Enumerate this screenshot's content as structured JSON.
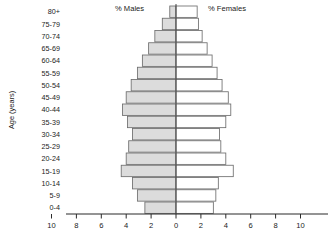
{
  "chart_data": {
    "type": "bar",
    "subtype": "population-pyramid",
    "title": "",
    "xlabel": "",
    "ylabel": "Age (years)",
    "grid": false,
    "legend_position": "top-inside",
    "xlim": [
      -11,
      11
    ],
    "xticks": [
      10,
      8,
      6,
      4,
      2,
      0,
      2,
      4,
      6,
      8,
      10
    ],
    "xtick_labels": [
      "10",
      "8",
      "6",
      "4",
      "2",
      "0",
      "2",
      "4",
      "6",
      "8",
      "10"
    ],
    "categories": [
      "0-4",
      "5-9",
      "10-14",
      "15-19",
      "20-24",
      "25-29",
      "30-34",
      "35-39",
      "40-44",
      "45-49",
      "50-54",
      "55-59",
      "60-64",
      "65-69",
      "70-74",
      "75-79",
      "80+"
    ],
    "series": [
      {
        "name": "% Males",
        "side": "left",
        "color": "#dcdcdc",
        "values": [
          2.5,
          3.1,
          3.5,
          4.4,
          4.0,
          3.8,
          3.5,
          3.9,
          4.3,
          4.0,
          3.6,
          3.1,
          2.7,
          2.2,
          1.7,
          1.1,
          0.5
        ]
      },
      {
        "name": "% Females",
        "side": "right",
        "color": "#ffffff",
        "values": [
          3.0,
          3.2,
          3.4,
          4.6,
          4.0,
          3.6,
          3.5,
          4.0,
          4.4,
          4.2,
          3.7,
          3.3,
          2.9,
          2.5,
          2.1,
          1.8,
          1.7
        ]
      }
    ]
  },
  "labels": {
    "males_legend": "% Males",
    "females_legend": "% Females",
    "y_axis_title": "Age (years)"
  }
}
